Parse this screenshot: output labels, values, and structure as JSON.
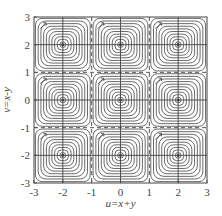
{
  "chart_data": {
    "type": "contour",
    "title": "",
    "xlabel": "u=x+y",
    "ylabel": "v=x-y",
    "xlim": [
      -3,
      3
    ],
    "ylim": [
      -3,
      3
    ],
    "xticks": [
      -3,
      -2,
      -1,
      0,
      1,
      2,
      3
    ],
    "yticks": [
      -3,
      -2,
      -1,
      0,
      1,
      2,
      3
    ],
    "xtick_labels": [
      "-3",
      "-2",
      "-1",
      "0",
      "1",
      "2",
      "3"
    ],
    "ytick_labels": [
      "-3",
      "-2",
      "-1",
      "0",
      "1",
      "2",
      "3"
    ],
    "grid": false,
    "legend": null,
    "cell_centers": [
      [
        -2,
        2
      ],
      [
        0,
        2
      ],
      [
        2,
        2
      ],
      [
        -2,
        0
      ],
      [
        0,
        0
      ],
      [
        2,
        0
      ],
      [
        -2,
        -2
      ],
      [
        0,
        -2
      ],
      [
        2,
        -2
      ]
    ],
    "separatrices": {
      "style": "dashed",
      "u": [
        -1,
        1
      ],
      "v": [
        -1,
        1
      ]
    },
    "center_crosshairs": {
      "style": "solid",
      "u": [
        -2,
        0,
        2
      ],
      "v": [
        -2,
        0,
        2
      ]
    },
    "contours_per_cell": 10,
    "contour_shape": "rounded-square closed orbits",
    "annotations": "small flow-direction arrow in top-left of each cell",
    "line_color": "#444444"
  }
}
